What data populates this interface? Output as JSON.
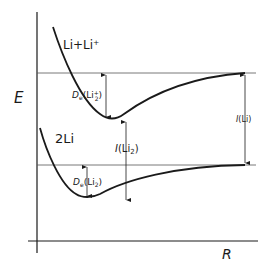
{
  "diagram": {
    "type": "potential-energy-curves",
    "axes": {
      "y_label": "E",
      "x_label": "R"
    },
    "curves": [
      {
        "name": "Li + Li+",
        "label": "Li+Li⁺",
        "asymptote": "upper"
      },
      {
        "name": "2 Li",
        "label": "2Li",
        "asymptote": "lower"
      }
    ],
    "annotations": {
      "de_li2_plus": {
        "prefix": "D",
        "sub": "e",
        "body": "(Li",
        "sub2": "2",
        "sup": "+",
        "close": ")"
      },
      "de_li2": {
        "prefix": "D",
        "sub": "e",
        "body": "(Li",
        "sub2": "2",
        "close": ")"
      },
      "i_li2": {
        "prefix": "I",
        "body": "(Li",
        "sub2": "2",
        "close": ")"
      },
      "i_li": {
        "prefix": "I",
        "body": "(Li)"
      }
    },
    "colors": {
      "stroke": "#1a1a1a",
      "thin": "#555555",
      "background": "#ffffff"
    }
  }
}
